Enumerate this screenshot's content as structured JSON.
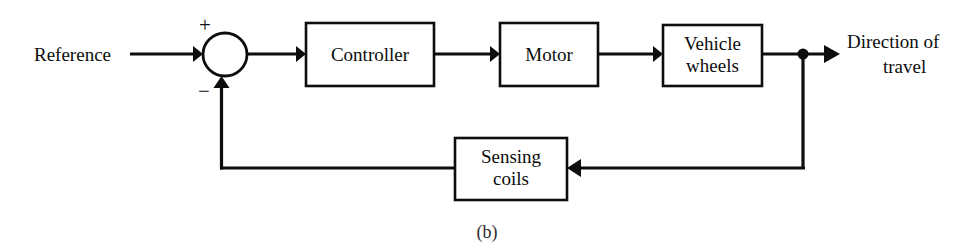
{
  "figure": {
    "caption": "(b)",
    "background_color": "#ffffff",
    "line_color": "#0d0d0d"
  },
  "inputs": {
    "reference_label": "Reference"
  },
  "outputs": {
    "direction_line1": "Direction of",
    "direction_line2": "travel"
  },
  "summing_junction": {
    "name": "summing-junction",
    "plus_sign": "+",
    "minus_sign": "−"
  },
  "blocks": [
    {
      "id": "controller",
      "label": "Controller",
      "line1": "Controller",
      "line2": ""
    },
    {
      "id": "motor",
      "label": "Motor",
      "line1": "Motor",
      "line2": ""
    },
    {
      "id": "vehicle-wheels",
      "label": "Vehicle wheels",
      "line1": "Vehicle",
      "line2": "wheels"
    },
    {
      "id": "sensing-coils",
      "label": "Sensing coils",
      "line1": "Sensing",
      "line2": "coils"
    }
  ]
}
